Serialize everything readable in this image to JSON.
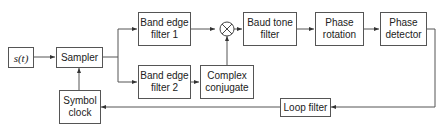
{
  "diagram": {
    "type": "block-diagram",
    "blocks": {
      "input": {
        "label": "s(t)"
      },
      "sampler": {
        "label": "Sampler"
      },
      "symbol_clock": {
        "line1": "Symbol",
        "line2": "clock"
      },
      "band_edge_1": {
        "line1": "Band edge",
        "line2": "filter 1"
      },
      "band_edge_2": {
        "line1": "Band edge",
        "line2": "filter 2"
      },
      "complex_conjugate": {
        "line1": "Complex",
        "line2": "conjugate"
      },
      "multiplier": {
        "symbol": "⊗"
      },
      "baud_tone": {
        "line1": "Baud tone",
        "line2": "filter"
      },
      "phase_rotation": {
        "line1": "Phase",
        "line2": "rotation"
      },
      "phase_detector": {
        "line1": "Phase",
        "line2": "detector"
      },
      "loop_filter": {
        "label": "Loop filter"
      }
    },
    "connections": [
      [
        "s(t)",
        "Sampler"
      ],
      [
        "Sampler",
        "Band edge filter 1"
      ],
      [
        "Sampler",
        "Band edge filter 2"
      ],
      [
        "Band edge filter 1",
        "Multiplier"
      ],
      [
        "Band edge filter 2",
        "Complex conjugate"
      ],
      [
        "Complex conjugate",
        "Multiplier"
      ],
      [
        "Multiplier",
        "Baud tone filter"
      ],
      [
        "Baud tone filter",
        "Phase rotation"
      ],
      [
        "Phase rotation",
        "Phase detector"
      ],
      [
        "Phase detector",
        "Loop filter"
      ],
      [
        "Loop filter",
        "Symbol clock"
      ],
      [
        "Symbol clock",
        "Sampler"
      ]
    ]
  }
}
